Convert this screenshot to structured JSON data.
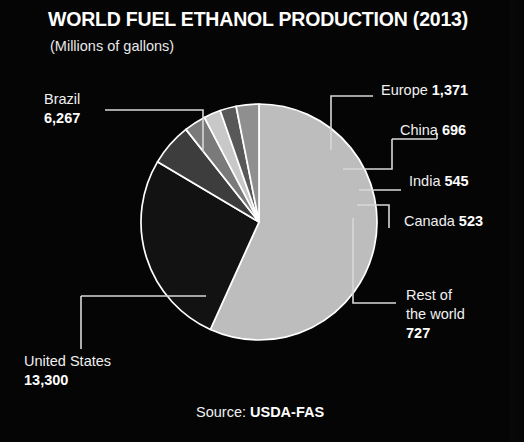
{
  "header": {
    "title": "WORLD FUEL ETHANOL PRODUCTION (2013)",
    "subtitle": "(Millions of gallons)"
  },
  "source": {
    "prefix": "Source: ",
    "value": "USDA-FAS"
  },
  "labels": {
    "brazil": {
      "name": "Brazil",
      "value": "6,267"
    },
    "us": {
      "name": "United States",
      "value": "13,300"
    },
    "europe": {
      "name": "Europe ",
      "value": "1,371"
    },
    "china": {
      "name": "China ",
      "value": "696"
    },
    "india": {
      "name": "India ",
      "value": "545"
    },
    "canada": {
      "name": "Canada ",
      "value": "523"
    },
    "rest": {
      "name_line1": "Rest of",
      "name_line2": "the world",
      "value": "727"
    }
  },
  "chart_data": {
    "type": "pie",
    "title": "WORLD FUEL ETHANOL PRODUCTION (2013)",
    "subtitle": "(Millions of gallons)",
    "unit": "Millions of gallons",
    "year": "2013",
    "source": "USDA-FAS",
    "legend_position": "callout-labels",
    "grid": false,
    "total": 23429,
    "start_angle_deg": -90,
    "direction": "counterclockwise",
    "categories": [
      "United States",
      "Brazil",
      "Europe",
      "Rest of the world",
      "China",
      "India",
      "Canada"
    ],
    "values": [
      13300,
      6267,
      1371,
      727,
      696,
      545,
      523
    ],
    "slices": [
      {
        "label": "United States",
        "value": 13300,
        "color": "#bdbdbd"
      },
      {
        "label": "Brazil",
        "value": 6267,
        "color": "#121212"
      },
      {
        "label": "Europe",
        "value": 1371,
        "color": "#3d3d3d"
      },
      {
        "label": "China",
        "value": 696,
        "color": "#7a7a7a"
      },
      {
        "label": "India",
        "value": 545,
        "color": "#c8c8c8"
      },
      {
        "label": "Canada",
        "value": 523,
        "color": "#585858"
      },
      {
        "label": "Rest of the world",
        "value": 727,
        "color": "#8f8f8f"
      }
    ]
  },
  "colors": {
    "background": "#050505",
    "text": "#f0f0f0",
    "slice_outline": "#ffffff",
    "leader_line": "#d8d8d8"
  }
}
